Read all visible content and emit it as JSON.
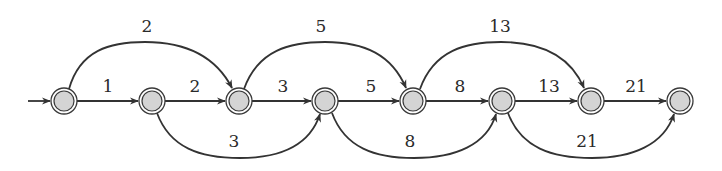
{
  "diagram": {
    "type": "state-transition-graph",
    "node_count": 8,
    "nodes": [
      {
        "id": "n0",
        "x": 64,
        "y": 101,
        "start": true
      },
      {
        "id": "n1",
        "x": 152,
        "y": 101
      },
      {
        "id": "n2",
        "x": 239,
        "y": 101
      },
      {
        "id": "n3",
        "x": 325,
        "y": 101
      },
      {
        "id": "n4",
        "x": 413,
        "y": 101
      },
      {
        "id": "n5",
        "x": 502,
        "y": 101
      },
      {
        "id": "n6",
        "x": 591,
        "y": 101
      },
      {
        "id": "n7",
        "x": 680,
        "y": 101
      }
    ],
    "edges": [
      {
        "from": "n0",
        "to": "n1",
        "kind": "straight",
        "label": "1"
      },
      {
        "from": "n1",
        "to": "n2",
        "kind": "straight",
        "label": "2"
      },
      {
        "from": "n2",
        "to": "n3",
        "kind": "straight",
        "label": "3"
      },
      {
        "from": "n3",
        "to": "n4",
        "kind": "straight",
        "label": "5"
      },
      {
        "from": "n4",
        "to": "n5",
        "kind": "straight",
        "label": "8"
      },
      {
        "from": "n5",
        "to": "n6",
        "kind": "straight",
        "label": "13"
      },
      {
        "from": "n6",
        "to": "n7",
        "kind": "straight",
        "label": "21"
      },
      {
        "from": "n0",
        "to": "n2",
        "kind": "arc-top",
        "label": "2"
      },
      {
        "from": "n2",
        "to": "n4",
        "kind": "arc-top",
        "label": "5"
      },
      {
        "from": "n4",
        "to": "n6",
        "kind": "arc-top",
        "label": "13"
      },
      {
        "from": "n1",
        "to": "n3",
        "kind": "arc-bottom",
        "label": "3"
      },
      {
        "from": "n3",
        "to": "n5",
        "kind": "arc-bottom",
        "label": "8"
      },
      {
        "from": "n5",
        "to": "n7",
        "kind": "arc-bottom",
        "label": "21"
      }
    ],
    "colors": {
      "edge": "#333333",
      "node_fill": "#d4d4d4",
      "node_stroke": "#3a3a3a",
      "label": "#2a2a2a"
    }
  }
}
